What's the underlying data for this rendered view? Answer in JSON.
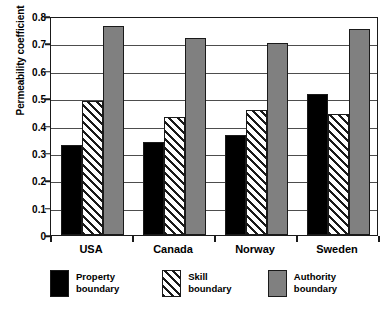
{
  "chart_data": {
    "type": "bar",
    "title": "",
    "xlabel": "",
    "ylabel": "Permeability coefficient",
    "ylim": [
      0,
      0.8
    ],
    "yticks": [
      "0.8",
      "0.7",
      "0.6",
      "0.5",
      "0.4",
      "0.3",
      "0.2",
      "0.1",
      "0"
    ],
    "ytick_values": [
      0.8,
      0.7,
      0.6,
      0.5,
      0.4,
      0.3,
      0.2,
      0.1,
      0
    ],
    "grid": "horizontal",
    "legend_position": "bottom",
    "categories": [
      "USA",
      "Canada",
      "Norway",
      "Sweden"
    ],
    "series": [
      {
        "name": "Property boundary",
        "name_line1": "Property",
        "name_line2": "boundary",
        "color": "#000000",
        "pattern": "solid",
        "values": [
          0.33,
          0.34,
          0.365,
          0.515
        ]
      },
      {
        "name": "Skill boundary",
        "name_line1": "Skill",
        "name_line2": "boundary",
        "color": "#ffffff",
        "pattern": "diagonal-hatch",
        "values": [
          0.49,
          0.432,
          0.455,
          0.443
        ]
      },
      {
        "name": "Authority boundary",
        "name_line1": "Authority",
        "name_line2": "boundary",
        "color": "#808080",
        "pattern": "solid",
        "values": [
          0.762,
          0.721,
          0.702,
          0.753
        ]
      }
    ]
  },
  "axis": {
    "y_title": "Permeability coefficient"
  },
  "colors": {
    "property": "#000000",
    "skill": "#ffffff",
    "authority": "#808080",
    "axis": "#1a1a1a",
    "grid": "#4d4d4d"
  }
}
